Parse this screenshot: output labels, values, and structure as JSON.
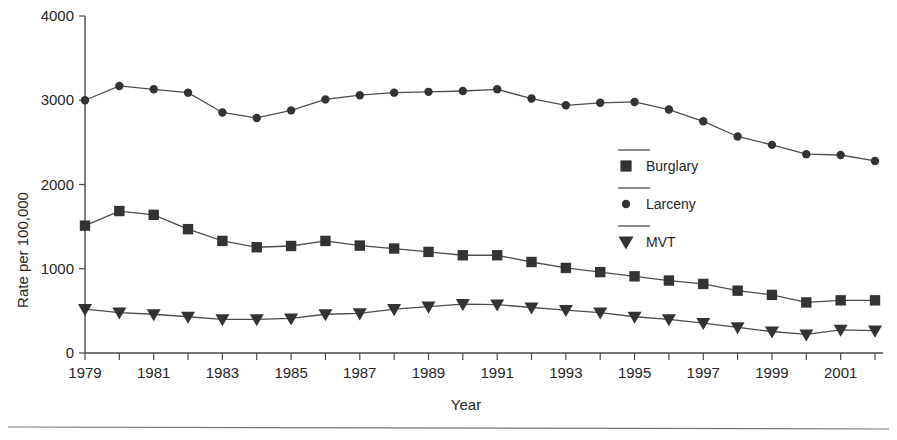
{
  "chart_data": {
    "type": "line",
    "title": "",
    "xlabel": "Year",
    "ylabel": "Rate per 100,000",
    "x": [
      1979,
      1980,
      1981,
      1982,
      1983,
      1984,
      1985,
      1986,
      1987,
      1988,
      1989,
      1990,
      1991,
      1992,
      1993,
      1994,
      1995,
      1996,
      1997,
      1998,
      1999,
      2000,
      2001,
      2002
    ],
    "xlim": [
      1979,
      2002
    ],
    "ylim": [
      0,
      4000
    ],
    "xticks": [
      1979,
      1980,
      1981,
      1982,
      1983,
      1984,
      1985,
      1986,
      1987,
      1988,
      1989,
      1990,
      1991,
      1992,
      1993,
      1994,
      1995,
      1996,
      1997,
      1998,
      1999,
      2000,
      2001,
      2002
    ],
    "xtick_labels": [
      "1979",
      "",
      "1981",
      "",
      "1983",
      "",
      "1985",
      "",
      "1987",
      "",
      "1989",
      "",
      "1991",
      "",
      "1993",
      "",
      "1995",
      "",
      "1997",
      "",
      "1999",
      "",
      "2001",
      ""
    ],
    "yticks": [
      0,
      1000,
      2000,
      3000,
      4000
    ],
    "ytick_labels": [
      "0",
      "1000",
      "2000",
      "3000",
      "4000"
    ],
    "grid": false,
    "legend_position": "center-right",
    "series": [
      {
        "name": "Burglary",
        "marker": "square",
        "color": "#333333",
        "values": [
          1512,
          1685,
          1640,
          1470,
          1330,
          1255,
          1270,
          1330,
          1275,
          1240,
          1200,
          1160,
          1160,
          1080,
          1010,
          960,
          910,
          860,
          820,
          740,
          690,
          600,
          625,
          625
        ]
      },
      {
        "name": "Larceny",
        "marker": "circle",
        "color": "#333333",
        "values": [
          3000,
          3170,
          3130,
          3090,
          2855,
          2790,
          2880,
          3010,
          3060,
          3090,
          3100,
          3110,
          3130,
          3020,
          2940,
          2970,
          2980,
          2890,
          2750,
          2570,
          2470,
          2360,
          2350,
          2280
        ]
      },
      {
        "name": "MVT",
        "marker": "triangle-down",
        "color": "#333333",
        "values": [
          520,
          480,
          460,
          430,
          400,
          400,
          410,
          460,
          470,
          520,
          550,
          580,
          575,
          540,
          510,
          480,
          430,
          400,
          355,
          305,
          255,
          220,
          275,
          265
        ]
      }
    ]
  },
  "legend": {
    "entries": [
      {
        "label": "Burglary",
        "marker": "square"
      },
      {
        "label": "Larceny",
        "marker": "circle"
      },
      {
        "label": "MVT",
        "marker": "triangle-down"
      }
    ]
  },
  "axes": {
    "x_title": "Year",
    "y_title": "Rate per 100,000"
  },
  "colors": {
    "marker": "#333333",
    "line": "#4d4d4d",
    "axis": "#4a4a4a",
    "text": "#262626",
    "background": "#ffffff",
    "rule": "#777777"
  }
}
